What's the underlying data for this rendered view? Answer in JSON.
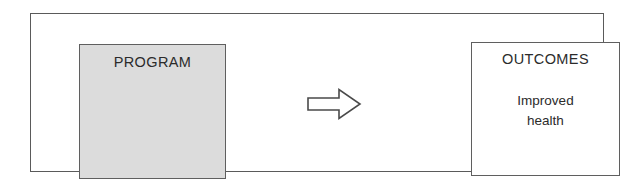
{
  "diagram": {
    "type": "flow",
    "orientation": "left-to-right",
    "background_color": "#ffffff",
    "frame": {
      "name": "outer-frame",
      "border_color": "#5a5a5a",
      "fill_color": "#ffffff"
    },
    "nodes": [
      {
        "id": "program",
        "title": "PROGRAM",
        "body": "",
        "fill_color": "#dcdcdc",
        "border_color": "#5f5f5f",
        "text_color": "#2b2b2b"
      },
      {
        "id": "outcomes",
        "title": "OUTCOMES",
        "body": "Improved\nhealth",
        "fill_color": "#ffffff",
        "border_color": "#5f5f5f",
        "text_color": "#2b2b2b"
      }
    ],
    "connector": {
      "id": "program-to-outcomes",
      "icon": "right-arrow-outline-icon",
      "from": "program",
      "to": "outcomes",
      "fill_color": "#ffffff",
      "stroke_color": "#4a4a4a"
    }
  }
}
